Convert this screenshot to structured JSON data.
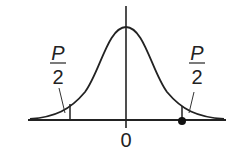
{
  "diagram": {
    "type": "normal-distribution-two-tailed",
    "origin_label": "0",
    "left_tail": {
      "numerator": "P",
      "denominator": "2"
    },
    "right_tail": {
      "numerator": "P",
      "denominator": "2"
    },
    "marker": "filled-dot-at-right-critical-value",
    "colors": {
      "stroke": "#222222",
      "background": "#ffffff"
    }
  }
}
